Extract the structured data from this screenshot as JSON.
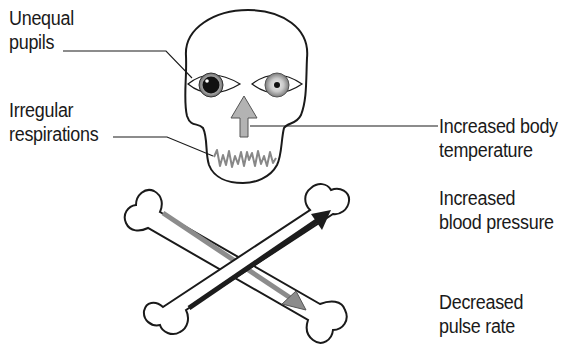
{
  "diagram": {
    "type": "medical-illustration",
    "labels": [
      {
        "id": "unequal-pupils",
        "lines": [
          "Unequal",
          "pupils"
        ],
        "side": "left",
        "pointer": "leader-line",
        "target": "left eye (dilated pupil)"
      },
      {
        "id": "irregular-respirations",
        "lines": [
          "Irregular",
          "respirations"
        ],
        "side": "left",
        "pointer": "leader-line",
        "target": "jagged waveform at mouth"
      },
      {
        "id": "increased-body-temperature",
        "lines": [
          "Increased body",
          "temperature"
        ],
        "side": "right",
        "pointer": "leader-line",
        "target": "upward arrow on nose"
      },
      {
        "id": "increased-blood-pressure",
        "lines": [
          "Increased",
          "blood pressure"
        ],
        "side": "right",
        "pointer": "none",
        "target": "dark upward-right arrow on bone"
      },
      {
        "id": "decreased-pulse-rate",
        "lines": [
          "Decreased",
          "pulse rate"
        ],
        "side": "right",
        "pointer": "none",
        "target": "grey downward-right arrow on bone"
      }
    ],
    "colors": {
      "outline": "#1a1a1a",
      "up_arrow_fill": "#b3b3b3",
      "bp_arrow": "#1c1c1c",
      "pulse_arrow": "#8c8c8c",
      "respiration_wave": "#888888",
      "background": "#ffffff"
    }
  }
}
